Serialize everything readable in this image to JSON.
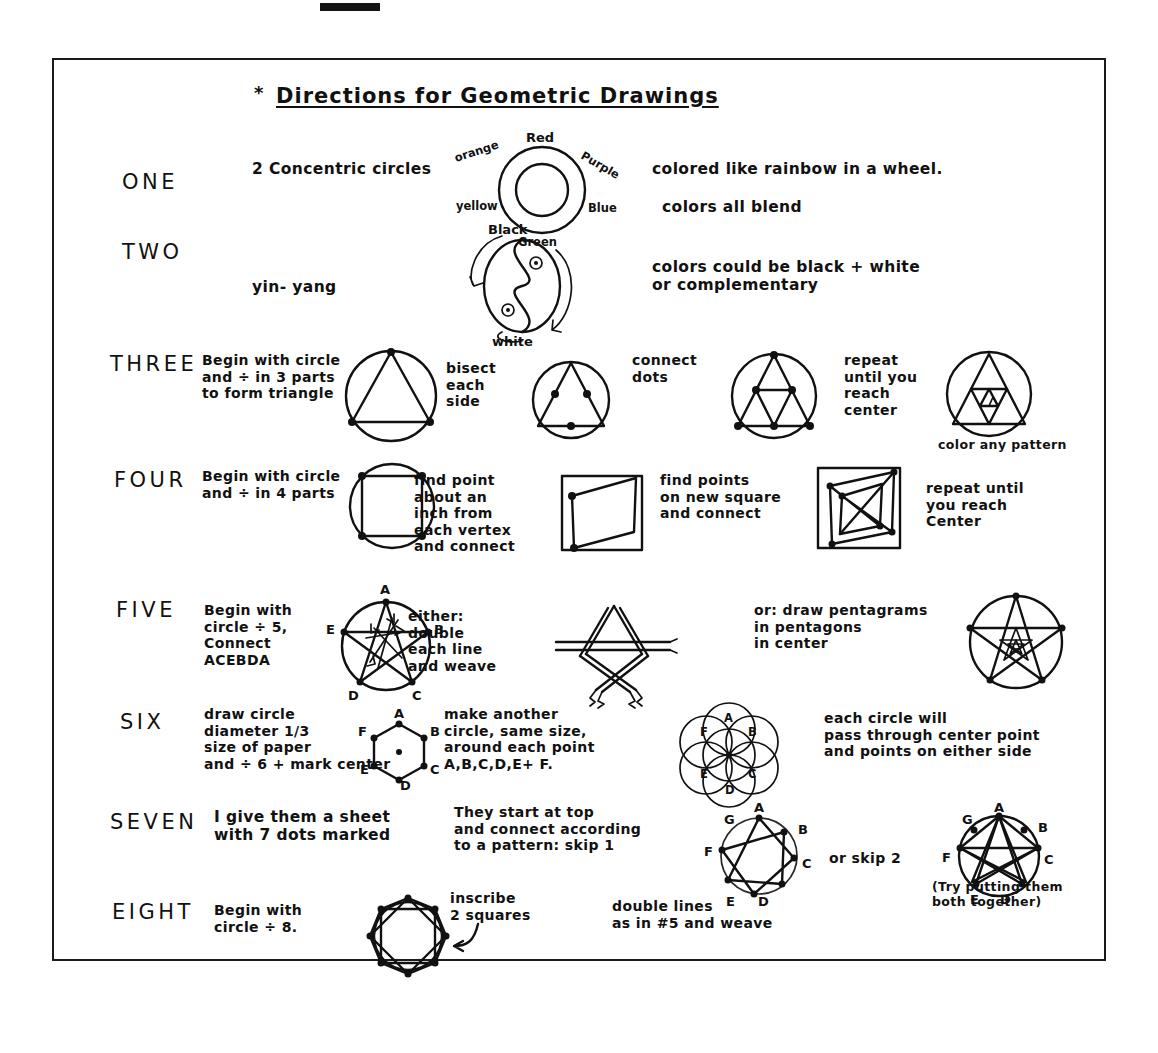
{
  "document": {
    "title_star": "*",
    "title": "Directions for Geometric Drawings"
  },
  "rows": [
    {
      "label": "ONE",
      "notes": [
        "2 Concentric circles",
        "colored  like rainbow in a wheel.",
        "colors all blend"
      ],
      "figure_labels": [
        "Red",
        "Purple",
        "Blue",
        "Green",
        "yellow",
        "orange"
      ],
      "figure": "color-wheel-two-concentric-circles"
    },
    {
      "label": "TWO",
      "notes": [
        "yin- yang",
        "colors could be  black + white\nor complementary"
      ],
      "figure_labels": [
        "Black",
        "white"
      ],
      "figure": "yin-yang-diagram"
    },
    {
      "label": "THREE",
      "notes": [
        "Begin with circle\nand ÷ in 3 parts\nto form triangle",
        "bisect\neach\nside",
        "connect\ndots",
        "repeat\nuntil you\nreach\ncenter",
        "color any pattern"
      ],
      "figure": "triangle-in-circle-series"
    },
    {
      "label": "FOUR",
      "notes": [
        "Begin with circle\nand ÷ in 4 parts",
        "find point\nabout an\ninch from\neach vertex\nand connect",
        "find points\non new square\nand connect",
        "repeat until\nyou reach\nCenter"
      ],
      "figure": "nested-squares-series"
    },
    {
      "label": "FIVE",
      "notes": [
        "Begin with\ncircle ÷ 5,\nConnect\nACEBDA",
        "either:\ndouble\neach line\nand weave",
        "or:  draw pentagrams\nin pentagons\nin center"
      ],
      "figure_labels": [
        "A",
        "B",
        "C",
        "D",
        "E"
      ],
      "figure": "pentagram-series"
    },
    {
      "label": "SIX",
      "notes": [
        "draw circle\ndiameter 1/3\nsize of paper\nand ÷ 6 + mark center",
        "make another\ncircle, same size,\naround each point\n A,B,C,D,E+ F.",
        "each circle will\npass through center point\nand points on either side"
      ],
      "figure_labels": [
        "A",
        "B",
        "C",
        "D",
        "E",
        "F"
      ],
      "figure": "hexagon-flower-of-life"
    },
    {
      "label": "SEVEN",
      "notes": [
        "I give them a sheet\nwith 7 dots marked",
        "They start at top\nand connect according\nto a pattern: skip 1",
        "or skip 2",
        "(Try putting them\nboth together)"
      ],
      "figure_labels": [
        "A",
        "B",
        "C",
        "D",
        "E",
        "F",
        "G"
      ],
      "figure": "heptagram-skip1-skip2"
    },
    {
      "label": "EIGHT",
      "notes": [
        "Begin with\ncircle ÷ 8.",
        "inscribe\n2 squares",
        "double lines\nas in #5 and weave"
      ],
      "figure": "octagram-two-squares"
    }
  ]
}
